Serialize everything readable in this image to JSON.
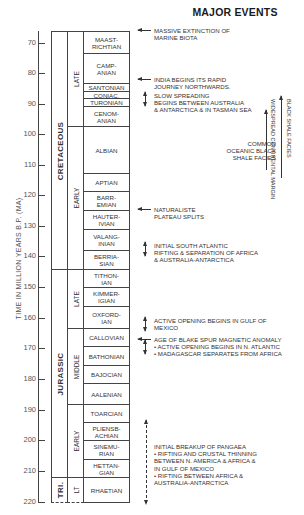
{
  "title": "MAJOR EVENTS",
  "axis": {
    "label": "TIME IN MILLION YEARS B.P. (MA)",
    "ticks": [
      {
        "value": "70",
        "y": 43
      },
      {
        "value": "80",
        "y": 73
      },
      {
        "value": "90",
        "y": 104
      },
      {
        "value": "100",
        "y": 134
      },
      {
        "value": "110",
        "y": 165
      },
      {
        "value": "120",
        "y": 195
      },
      {
        "value": "130",
        "y": 226
      },
      {
        "value": "140",
        "y": 256
      },
      {
        "value": "150",
        "y": 287
      },
      {
        "value": "160",
        "y": 318
      },
      {
        "value": "170",
        "y": 348
      },
      {
        "value": "180",
        "y": 379
      },
      {
        "value": "190",
        "y": 410
      },
      {
        "value": "200",
        "y": 440
      },
      {
        "value": "210",
        "y": 471
      },
      {
        "value": "220",
        "y": 502
      }
    ]
  },
  "periods": [
    {
      "name": "CRETACEOUS",
      "top": 31,
      "bottom": 269
    },
    {
      "name": "JURASSIC",
      "top": 269,
      "bottom": 477
    },
    {
      "name": "TRI.",
      "top": 477,
      "bottom": 502
    }
  ],
  "epochs": [
    {
      "name": "LATE",
      "top": 31,
      "bottom": 126
    },
    {
      "name": "EARLY",
      "top": 126,
      "bottom": 269
    },
    {
      "name": "LATE",
      "top": 269,
      "bottom": 328
    },
    {
      "name": "MIDDLE",
      "top": 328,
      "bottom": 404
    },
    {
      "name": "EARLY",
      "top": 404,
      "bottom": 477
    },
    {
      "name": "LT",
      "top": 477,
      "bottom": 502
    }
  ],
  "stages": [
    {
      "name": "MAAST-\nRICHTIAN",
      "top": 31,
      "bottom": 53
    },
    {
      "name": "CAMP-\nANIAN",
      "top": 53,
      "bottom": 83
    },
    {
      "name": "SANTONIAN",
      "top": 83,
      "bottom": 91
    },
    {
      "name": "CONIAC.",
      "top": 91,
      "bottom": 98
    },
    {
      "name": "TURONIAN",
      "top": 98,
      "bottom": 106
    },
    {
      "name": "CENOM-\nANIAN",
      "top": 106,
      "bottom": 126
    },
    {
      "name": "ALBIAN",
      "top": 126,
      "bottom": 173
    },
    {
      "name": "APTIAN",
      "top": 173,
      "bottom": 191
    },
    {
      "name": "BARR-\nEMIAN",
      "top": 191,
      "bottom": 210
    },
    {
      "name": "HAUTER-\nIVIAN",
      "top": 210,
      "bottom": 229
    },
    {
      "name": "VALANG-\nINIAN",
      "top": 229,
      "bottom": 250
    },
    {
      "name": "BERRIA-\nSIAN",
      "top": 250,
      "bottom": 269
    },
    {
      "name": "TITHON-\nIAN",
      "top": 269,
      "bottom": 287
    },
    {
      "name": "KIMMER-\nIGIAN",
      "top": 287,
      "bottom": 306
    },
    {
      "name": "OXFORD-\nIAN",
      "top": 306,
      "bottom": 328
    },
    {
      "name": "CALLOVIAN",
      "top": 328,
      "bottom": 346
    },
    {
      "name": "BATHONIAN",
      "top": 346,
      "bottom": 365
    },
    {
      "name": "BAJOCIAN",
      "top": 365,
      "bottom": 383
    },
    {
      "name": "AALENIAN",
      "top": 383,
      "bottom": 404
    },
    {
      "name": "TOARCIAN",
      "top": 404,
      "bottom": 422
    },
    {
      "name": "PLIENSB-\nACHIAN",
      "top": 422,
      "bottom": 440
    },
    {
      "name": "SINEMU-\nRIAN",
      "top": 440,
      "bottom": 459
    },
    {
      "name": "HETTAN-\nGIAN",
      "top": 459,
      "bottom": 477
    },
    {
      "name": "RHAETIAN",
      "top": 477,
      "bottom": 502
    }
  ],
  "events": [
    {
      "id": "extinction",
      "text": "MASSIVE EXTINCTION OF\nMARINE BIOTA",
      "top": 27,
      "marker": "arrow-left"
    },
    {
      "id": "india",
      "text": "INDIA BEGINS ITS RAPID\nJOURNEY NORTHWARDS.",
      "top": 76,
      "marker": "arrow-left"
    },
    {
      "id": "slow-spreading",
      "text": "SLOW SPREADING\nBEGINS BETWEEN AUSTRALIA\n& ANTARCTICA & IN TASMAN SEA",
      "top": 92,
      "marker": "range"
    },
    {
      "id": "naturaliste",
      "text": "NATURALISTE\nPLATEAU SPLITS",
      "top": 206,
      "marker": "arrow-left"
    },
    {
      "id": "south-atlantic",
      "text": "INITIAL SOUTH ATLANTIC\nRIFTING & SEPARATION OF AFRICA\n& AUSTRALIA-ANTARCTICA",
      "top": 242,
      "marker": "range"
    },
    {
      "id": "gulf-mexico",
      "text": "ACTIVE OPENING BEGINS IN GULF OF\nMEXICO",
      "top": 317,
      "marker": "range"
    },
    {
      "id": "blake-spur",
      "text": "AGE OF BLAKE SPUR MAGNETIC ANOMALY\n  • ACTIVE OPENING BEGINS IN N. ATLANTIC\n  • MADAGASCAR SEPARATES FROM AFRICA",
      "top": 336,
      "marker": "arrow-left-range"
    },
    {
      "id": "pangaea",
      "text": "INITIAL BREAKUP OF PANGAEA\n  • RIFTING AND CRUSTAL THINNING\n    BETWEEN N. AMERICA & AFRICA &\n    IN GULF OF MEXICO\n  • RIFTING BETWEEN AFRICA &\n    AUSTRALIA-ANTARCTICA",
      "top": 443,
      "marker": "dashed-range"
    }
  ],
  "facies": {
    "label": "COMMON\nOCEANIC BLACK\nSHALE FACIES",
    "side_label_1": "WIDESPREAD CONTINENTAL MARGIN",
    "side_label_2": "BLACK SHALE FACIES"
  }
}
